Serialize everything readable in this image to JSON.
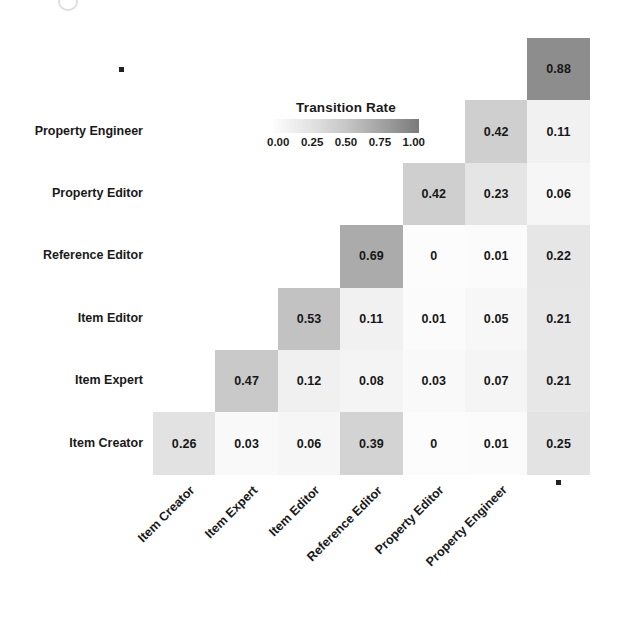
{
  "chart_data": {
    "type": "heatmap",
    "title": "",
    "legend_title": "Transition Rate",
    "legend_position": "inside-upper-left",
    "legend_ticks": [
      "0.00",
      "0.25",
      "0.50",
      "0.75",
      "1.00"
    ],
    "colorscale": {
      "low_color": "#f7f7f7",
      "high_color": "#7a7a7a",
      "vmin": 0,
      "vmax": 1
    },
    "xlabel": "",
    "ylabel": "",
    "grid": false,
    "triangular": "lower",
    "x_categories": [
      "Item Creator",
      "Item Expert",
      "Item Editor",
      "Reference Editor",
      "Property Editor",
      "Property Engineer",
      "▪"
    ],
    "y_categories": [
      "Item Creator",
      "Item Expert",
      "Item Editor",
      "Reference Editor",
      "Property Editor",
      "Property Engineer",
      "▪"
    ],
    "y_categories_display_top_to_bottom": [
      "▪",
      "Property Engineer",
      "Property Editor",
      "Reference Editor",
      "Item Editor",
      "Item Expert",
      "Item Creator"
    ],
    "cells": [
      {
        "row": 6,
        "col": 6,
        "row_label": "▪",
        "col_label": "▪",
        "value": 0.88,
        "text": "0.88"
      },
      {
        "row": 5,
        "col": 5,
        "row_label": "Property Engineer",
        "col_label": "Property Engineer",
        "value": 0.42,
        "text": "0.42"
      },
      {
        "row": 5,
        "col": 6,
        "row_label": "Property Engineer",
        "col_label": "▪",
        "value": 0.11,
        "text": "0.11"
      },
      {
        "row": 4,
        "col": 4,
        "row_label": "Property Editor",
        "col_label": "Property Editor",
        "value": 0.42,
        "text": "0.42"
      },
      {
        "row": 4,
        "col": 5,
        "row_label": "Property Editor",
        "col_label": "Property Engineer",
        "value": 0.23,
        "text": "0.23"
      },
      {
        "row": 4,
        "col": 6,
        "row_label": "Property Editor",
        "col_label": "▪",
        "value": 0.06,
        "text": "0.06"
      },
      {
        "row": 3,
        "col": 3,
        "row_label": "Reference Editor",
        "col_label": "Reference Editor",
        "value": 0.69,
        "text": "0.69"
      },
      {
        "row": 3,
        "col": 4,
        "row_label": "Reference Editor",
        "col_label": "Property Editor",
        "value": 0,
        "text": "0"
      },
      {
        "row": 3,
        "col": 5,
        "row_label": "Reference Editor",
        "col_label": "Property Engineer",
        "value": 0.01,
        "text": "0.01"
      },
      {
        "row": 3,
        "col": 6,
        "row_label": "Reference Editor",
        "col_label": "▪",
        "value": 0.22,
        "text": "0.22"
      },
      {
        "row": 2,
        "col": 2,
        "row_label": "Item Editor",
        "col_label": "Item Editor",
        "value": 0.53,
        "text": "0.53"
      },
      {
        "row": 2,
        "col": 3,
        "row_label": "Item Editor",
        "col_label": "Reference Editor",
        "value": 0.11,
        "text": "0.11"
      },
      {
        "row": 2,
        "col": 4,
        "row_label": "Item Editor",
        "col_label": "Property Editor",
        "value": 0.01,
        "text": "0.01"
      },
      {
        "row": 2,
        "col": 5,
        "row_label": "Item Editor",
        "col_label": "Property Engineer",
        "value": 0.05,
        "text": "0.05"
      },
      {
        "row": 2,
        "col": 6,
        "row_label": "Item Editor",
        "col_label": "▪",
        "value": 0.21,
        "text": "0.21"
      },
      {
        "row": 1,
        "col": 1,
        "row_label": "Item Expert",
        "col_label": "Item Expert",
        "value": 0.47,
        "text": "0.47"
      },
      {
        "row": 1,
        "col": 2,
        "row_label": "Item Expert",
        "col_label": "Item Editor",
        "value": 0.12,
        "text": "0.12"
      },
      {
        "row": 1,
        "col": 3,
        "row_label": "Item Expert",
        "col_label": "Reference Editor",
        "value": 0.08,
        "text": "0.08"
      },
      {
        "row": 1,
        "col": 4,
        "row_label": "Item Expert",
        "col_label": "Property Editor",
        "value": 0.03,
        "text": "0.03"
      },
      {
        "row": 1,
        "col": 5,
        "row_label": "Item Expert",
        "col_label": "Property Engineer",
        "value": 0.07,
        "text": "0.07"
      },
      {
        "row": 1,
        "col": 6,
        "row_label": "Item Expert",
        "col_label": "▪",
        "value": 0.21,
        "text": "0.21"
      },
      {
        "row": 0,
        "col": 0,
        "row_label": "Item Creator",
        "col_label": "Item Creator",
        "value": 0.26,
        "text": "0.26"
      },
      {
        "row": 0,
        "col": 1,
        "row_label": "Item Creator",
        "col_label": "Item Expert",
        "value": 0.03,
        "text": "0.03"
      },
      {
        "row": 0,
        "col": 2,
        "row_label": "Item Creator",
        "col_label": "Item Editor",
        "value": 0.06,
        "text": "0.06"
      },
      {
        "row": 0,
        "col": 3,
        "row_label": "Item Creator",
        "col_label": "Reference Editor",
        "value": 0.39,
        "text": "0.39"
      },
      {
        "row": 0,
        "col": 4,
        "row_label": "Item Creator",
        "col_label": "Property Editor",
        "value": 0,
        "text": "0"
      },
      {
        "row": 0,
        "col": 5,
        "row_label": "Item Creator",
        "col_label": "Property Engineer",
        "value": 0.01,
        "text": "0.01"
      },
      {
        "row": 0,
        "col": 6,
        "row_label": "Item Creator",
        "col_label": "▪",
        "value": 0.25,
        "text": "0.25"
      }
    ]
  }
}
